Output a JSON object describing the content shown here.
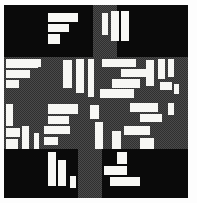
{
  "figure": {
    "type": "abstract-geometric-composition",
    "width": 197,
    "height": 203,
    "background_color": "#fdfdfd",
    "palette": {
      "black": "#0a0a0a",
      "gray_dither": "#4a4a4a",
      "gray_dither_dark": "#303030",
      "white": "#f7f7f4"
    },
    "panel": {
      "x": 4,
      "y": 5,
      "w": 184,
      "h": 193
    }
  },
  "gray_regions": [
    {
      "name": "center-band-horizontal",
      "x": 4,
      "y": 57,
      "w": 184,
      "h": 92
    },
    {
      "name": "arm-top-vertical",
      "x": 93,
      "y": 5,
      "w": 24,
      "h": 52
    },
    {
      "name": "arm-bottom-vertical",
      "x": 78,
      "y": 149,
      "w": 24,
      "h": 49
    }
  ],
  "black_regions": [
    {
      "name": "corner-top-left",
      "x": 4,
      "y": 5,
      "w": 89,
      "h": 52
    },
    {
      "name": "corner-top-right",
      "x": 117,
      "y": 5,
      "w": 71,
      "h": 52
    },
    {
      "name": "corner-bottom-left",
      "x": 4,
      "y": 149,
      "w": 74,
      "h": 49
    },
    {
      "name": "corner-bottom-right",
      "x": 102,
      "y": 149,
      "w": 86,
      "h": 49
    }
  ],
  "white_rectangles": [
    {
      "x": 48,
      "y": 13,
      "w": 30,
      "h": 9
    },
    {
      "x": 48,
      "y": 24,
      "w": 21,
      "h": 8
    },
    {
      "x": 48,
      "y": 34,
      "w": 12,
      "h": 10
    },
    {
      "x": 102,
      "y": 13,
      "w": 6,
      "h": 22
    },
    {
      "x": 111,
      "y": 11,
      "w": 8,
      "h": 30
    },
    {
      "x": 121,
      "y": 11,
      "w": 8,
      "h": 30
    },
    {
      "x": 6,
      "y": 59,
      "w": 32,
      "h": 9
    },
    {
      "x": 6,
      "y": 70,
      "w": 24,
      "h": 8
    },
    {
      "x": 6,
      "y": 80,
      "w": 13,
      "h": 8
    },
    {
      "x": 33,
      "y": 59,
      "w": 8,
      "h": 8
    },
    {
      "x": 63,
      "y": 60,
      "w": 9,
      "h": 28
    },
    {
      "x": 76,
      "y": 59,
      "w": 8,
      "h": 34
    },
    {
      "x": 88,
      "y": 59,
      "w": 6,
      "h": 38
    },
    {
      "x": 102,
      "y": 59,
      "w": 34,
      "h": 8
    },
    {
      "x": 121,
      "y": 69,
      "w": 30,
      "h": 8
    },
    {
      "x": 112,
      "y": 79,
      "w": 28,
      "h": 9
    },
    {
      "x": 100,
      "y": 89,
      "w": 34,
      "h": 9
    },
    {
      "x": 146,
      "y": 60,
      "w": 8,
      "h": 26
    },
    {
      "x": 158,
      "y": 59,
      "w": 7,
      "h": 20
    },
    {
      "x": 168,
      "y": 59,
      "w": 6,
      "h": 18
    },
    {
      "x": 160,
      "y": 82,
      "w": 12,
      "h": 8
    },
    {
      "x": 174,
      "y": 84,
      "w": 5,
      "h": 10
    },
    {
      "x": 6,
      "y": 104,
      "w": 7,
      "h": 22
    },
    {
      "x": 6,
      "y": 128,
      "w": 14,
      "h": 9
    },
    {
      "x": 6,
      "y": 139,
      "w": 12,
      "h": 10
    },
    {
      "x": 22,
      "y": 126,
      "w": 7,
      "h": 23
    },
    {
      "x": 34,
      "y": 133,
      "w": 5,
      "h": 16
    },
    {
      "x": 48,
      "y": 104,
      "w": 30,
      "h": 10
    },
    {
      "x": 48,
      "y": 116,
      "w": 21,
      "h": 8
    },
    {
      "x": 44,
      "y": 126,
      "w": 26,
      "h": 8
    },
    {
      "x": 44,
      "y": 137,
      "w": 14,
      "h": 8
    },
    {
      "x": 90,
      "y": 105,
      "w": 9,
      "h": 14
    },
    {
      "x": 95,
      "y": 122,
      "w": 8,
      "h": 27
    },
    {
      "x": 112,
      "y": 131,
      "w": 9,
      "h": 18
    },
    {
      "x": 130,
      "y": 103,
      "w": 28,
      "h": 9
    },
    {
      "x": 140,
      "y": 114,
      "w": 22,
      "h": 8
    },
    {
      "x": 124,
      "y": 126,
      "w": 26,
      "h": 9
    },
    {
      "x": 140,
      "y": 138,
      "w": 14,
      "h": 11
    },
    {
      "x": 168,
      "y": 103,
      "w": 6,
      "h": 12
    },
    {
      "x": 48,
      "y": 152,
      "w": 8,
      "h": 34
    },
    {
      "x": 58,
      "y": 160,
      "w": 8,
      "h": 26
    },
    {
      "x": 70,
      "y": 176,
      "w": 6,
      "h": 12
    },
    {
      "x": 117,
      "y": 152,
      "w": 10,
      "h": 12
    },
    {
      "x": 104,
      "y": 166,
      "w": 23,
      "h": 9
    },
    {
      "x": 110,
      "y": 177,
      "w": 30,
      "h": 9
    }
  ]
}
